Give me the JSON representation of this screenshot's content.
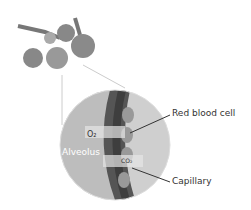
{
  "labels": {
    "red_blood_cell": "Red blood cell",
    "capillary": "Capillary",
    "alveolus": "Alveolus",
    "o2": "O₂",
    "co2": "CO₂"
  }
}
